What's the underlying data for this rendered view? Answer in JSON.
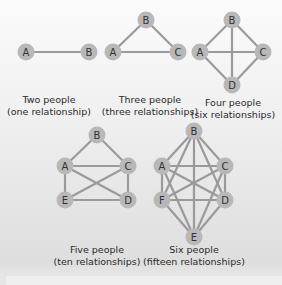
{
  "colors": {
    "node_fill": "#b8b8b8",
    "edge": "#9a9a9a",
    "text": "#2a2a2a"
  },
  "graphs": [
    {
      "id": "two",
      "caption_line1": "Two people",
      "caption_line2": "(one relationship)",
      "nodes": [
        {
          "label": "A",
          "x": 26,
          "y": 52
        },
        {
          "label": "B",
          "x": 89,
          "y": 52
        }
      ],
      "edges": [
        [
          "A",
          "B"
        ]
      ]
    },
    {
      "id": "three",
      "caption_line1": "Three people",
      "caption_line2": "(three relationships)",
      "nodes": [
        {
          "label": "A",
          "x": 113,
          "y": 52
        },
        {
          "label": "B",
          "x": 146,
          "y": 20
        },
        {
          "label": "C",
          "x": 178,
          "y": 52
        }
      ],
      "edges": [
        [
          "A",
          "B"
        ],
        [
          "B",
          "C"
        ],
        [
          "A",
          "C"
        ]
      ]
    },
    {
      "id": "four",
      "caption_line1": "Four people",
      "caption_line2": "(six relationships)",
      "nodes": [
        {
          "label": "A",
          "x": 200,
          "y": 52
        },
        {
          "label": "B",
          "x": 232,
          "y": 20
        },
        {
          "label": "C",
          "x": 263,
          "y": 52
        },
        {
          "label": "D",
          "x": 232,
          "y": 85
        }
      ],
      "edges": [
        [
          "A",
          "B"
        ],
        [
          "B",
          "C"
        ],
        [
          "C",
          "D"
        ],
        [
          "D",
          "A"
        ],
        [
          "A",
          "C"
        ],
        [
          "B",
          "D"
        ]
      ]
    },
    {
      "id": "five",
      "caption_line1": "Five people",
      "caption_line2": "(ten relationships)",
      "nodes": [
        {
          "label": "A",
          "x": 65,
          "y": 166
        },
        {
          "label": "B",
          "x": 97,
          "y": 135
        },
        {
          "label": "C",
          "x": 128,
          "y": 166
        },
        {
          "label": "D",
          "x": 128,
          "y": 200
        },
        {
          "label": "E",
          "x": 65,
          "y": 200
        }
      ],
      "edges": [
        [
          "A",
          "B"
        ],
        [
          "B",
          "C"
        ],
        [
          "A",
          "C"
        ],
        [
          "A",
          "E"
        ],
        [
          "C",
          "D"
        ],
        [
          "E",
          "D"
        ],
        [
          "A",
          "D"
        ],
        [
          "C",
          "E"
        ]
      ]
    },
    {
      "id": "six",
      "caption_line1": "Six people",
      "caption_line2": "(fifteen relationships)",
      "nodes": [
        {
          "label": "A",
          "x": 162,
          "y": 166
        },
        {
          "label": "B",
          "x": 194,
          "y": 131
        },
        {
          "label": "C",
          "x": 225,
          "y": 166
        },
        {
          "label": "D",
          "x": 225,
          "y": 200
        },
        {
          "label": "E",
          "x": 194,
          "y": 237
        },
        {
          "label": "F",
          "x": 162,
          "y": 200
        }
      ],
      "edges": [
        [
          "A",
          "B"
        ],
        [
          "A",
          "C"
        ],
        [
          "A",
          "D"
        ],
        [
          "A",
          "E"
        ],
        [
          "A",
          "F"
        ],
        [
          "B",
          "C"
        ],
        [
          "B",
          "D"
        ],
        [
          "B",
          "E"
        ],
        [
          "B",
          "F"
        ],
        [
          "C",
          "D"
        ],
        [
          "C",
          "E"
        ],
        [
          "C",
          "F"
        ],
        [
          "D",
          "E"
        ],
        [
          "D",
          "F"
        ],
        [
          "E",
          "F"
        ]
      ]
    }
  ],
  "captions": [
    {
      "graph": "two",
      "x": 49,
      "y": 100
    },
    {
      "graph": "three",
      "x": 150,
      "y": 100
    },
    {
      "graph": "four",
      "x": 233,
      "y": 102
    },
    {
      "graph": "five",
      "x": 97,
      "y": 249
    },
    {
      "graph": "six",
      "x": 193,
      "y": 249
    }
  ]
}
